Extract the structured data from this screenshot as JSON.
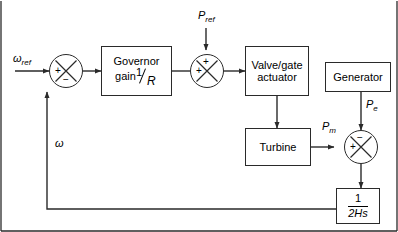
{
  "diagram": {
    "background_color": "#ffffff",
    "line_color": "#2a2a2a",
    "text_color": "#000000"
  },
  "blocks": {
    "governor": {
      "line1": "Governor",
      "line2": "gain",
      "fraction_numerator": "1",
      "fraction_denominator": "R"
    },
    "valve_actuator": {
      "line1": "Valve/gate",
      "line2": "actuator"
    },
    "turbine": {
      "label": "Turbine"
    },
    "generator": {
      "label": "Generator"
    },
    "inertia": {
      "numerator": "1",
      "denominator": "2Hs"
    }
  },
  "signals": {
    "omega_ref": {
      "base": "ω",
      "subscript": "ref"
    },
    "p_ref": {
      "base": "P",
      "subscript": "ref"
    },
    "p_e": {
      "base": "P",
      "subscript": "e"
    },
    "p_m": {
      "base": "P",
      "subscript": "m"
    },
    "omega_feedback": {
      "base": "ω"
    }
  },
  "junctions": {
    "speed_error": {
      "name": "speed-error-summing-junction",
      "sign_left": "+",
      "sign_bottom": "−"
    },
    "power_reference": {
      "name": "power-reference-summing-junction",
      "sign_left": "+",
      "sign_top": "+"
    },
    "power_balance": {
      "name": "power-balance-summing-junction",
      "sign_left": "+",
      "sign_top": "−"
    }
  }
}
